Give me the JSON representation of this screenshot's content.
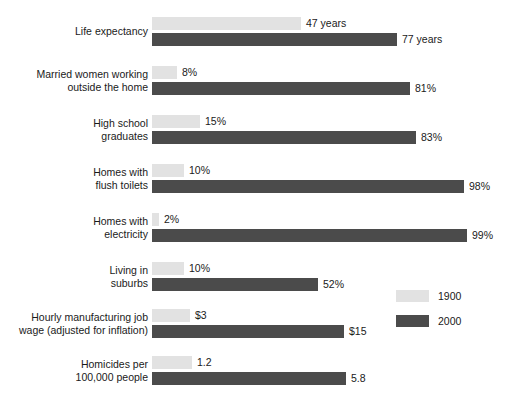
{
  "chart_data": {
    "type": "bar",
    "orientation": "horizontal",
    "title": "",
    "subtitle": "",
    "xlabel": "",
    "ylabel": "",
    "grid": false,
    "legend_position": "right-lower",
    "series": [
      {
        "name": "1900",
        "color": "#e2e2e2"
      },
      {
        "name": "2000",
        "color": "#4b4b4b"
      }
    ],
    "categories": [
      "Life expectancy",
      "Married women working outside the home",
      "High school graduates",
      "Homes with flush toilets",
      "Homes with electricity",
      "Living in suburbs",
      "Hourly manufacturing job wage (adjusted for inflation)",
      "Homicides per 100,000 people"
    ],
    "values_1900": [
      47,
      8,
      15,
      10,
      2,
      10,
      3,
      1.2
    ],
    "values_2000": [
      77,
      81,
      83,
      98,
      99,
      52,
      15,
      5.8
    ],
    "value_labels_1900": [
      "47 years",
      "8%",
      "15%",
      "10%",
      "2%",
      "10%",
      "$3",
      "1.2"
    ],
    "value_labels_2000": [
      "77 years",
      "81%",
      "83%",
      "98%",
      "99%",
      "52%",
      "$15",
      "5.8"
    ]
  },
  "rows": [
    {
      "label": "Life expectancy",
      "old_label": "47 years",
      "new_label": "77 years",
      "old_width": 149,
      "new_width": 245
    },
    {
      "label": "Married women working\noutside the home",
      "old_label": "8%",
      "new_label": "81%",
      "old_width": 25,
      "new_width": 258
    },
    {
      "label": "High school\ngraduates",
      "old_label": "15%",
      "new_label": "83%",
      "old_width": 48,
      "new_width": 264
    },
    {
      "label": "Homes with\nflush toilets",
      "old_label": "10%",
      "new_label": "98%",
      "old_width": 32,
      "new_width": 312
    },
    {
      "label": "Homes with\nelectricity",
      "old_label": "2%",
      "new_label": "99%",
      "old_width": 7,
      "new_width": 315
    },
    {
      "label": "Living in\nsuburbs",
      "old_label": "10%",
      "new_label": "52%",
      "old_width": 32,
      "new_width": 166
    },
    {
      "label": "Hourly manufacturing job\nwage (adjusted for inflation)",
      "old_label": "$3",
      "new_label": "$15",
      "old_width": 38,
      "new_width": 192
    },
    {
      "label": "Homicides per\n100,000 people",
      "old_label": "1.2",
      "new_label": "5.8",
      "old_width": 40,
      "new_width": 194
    }
  ],
  "legend": {
    "items": [
      {
        "label": "1900",
        "swatch": "old"
      },
      {
        "label": "2000",
        "swatch": "new"
      }
    ]
  }
}
